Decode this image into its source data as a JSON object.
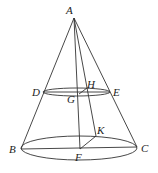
{
  "diagram": {
    "type": "cone-geometry",
    "stroke_color": "#333333",
    "points": {
      "A": {
        "label": "A",
        "x": 74,
        "y": 18,
        "lx": 66,
        "ly": 14
      },
      "B": {
        "label": "B",
        "x": 21,
        "y": 149,
        "lx": 9,
        "ly": 153
      },
      "C": {
        "label": "C",
        "x": 137,
        "y": 147,
        "lx": 141,
        "ly": 152
      },
      "D": {
        "label": "D",
        "x": 43,
        "y": 92,
        "lx": 32,
        "ly": 96
      },
      "E": {
        "label": "E",
        "x": 110,
        "y": 92,
        "lx": 113,
        "ly": 96
      },
      "F": {
        "label": "F",
        "x": 80,
        "y": 149,
        "lx": 75,
        "ly": 161
      },
      "G": {
        "label": "G",
        "x": 79,
        "y": 94,
        "lx": 67,
        "ly": 103
      },
      "H": {
        "label": "H",
        "x": 87,
        "y": 88,
        "lx": 87,
        "ly": 88
      },
      "K": {
        "label": "K",
        "x": 96,
        "y": 136,
        "lx": 97,
        "ly": 134
      }
    },
    "segments": [
      "AB",
      "AC",
      "AF",
      "AK",
      "BC",
      "FK",
      "DE",
      "GH"
    ],
    "ellipses": [
      {
        "name": "base-circle",
        "cx": 79,
        "cy": 148,
        "rx": 58,
        "ry": 12
      },
      {
        "name": "section-circle",
        "cx": 76.5,
        "cy": 92,
        "rx": 33.5,
        "ry": 4
      }
    ]
  }
}
